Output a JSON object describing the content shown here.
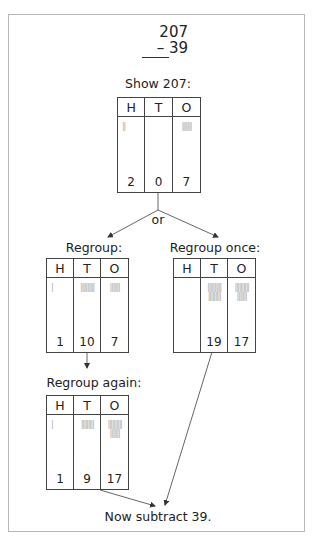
{
  "problem": {
    "top": "207",
    "bottom": "– 39"
  },
  "labels": {
    "show": "Show 207:",
    "or": "or",
    "regroup": "Regroup:",
    "regroup_once": "Regroup once:",
    "regroup_again": "Regroup again:",
    "final": "Now subtract 39."
  },
  "headers": {
    "h": "H",
    "t": "T",
    "o": "O"
  },
  "tables": {
    "show": {
      "h": "2",
      "t": "0",
      "o": "7",
      "h_tally": "||",
      "t_tally": "",
      "o_tally": "|||||||"
    },
    "regroup": {
      "h": "1",
      "t": "10",
      "o": "7",
      "h_tally": "|",
      "t_tally": "||||||||||",
      "o_tally": "|||||||"
    },
    "regroup_once": {
      "h": "",
      "t": "19",
      "o": "17",
      "h_tally": "",
      "t_tally": "||||||||||\n|||||||||",
      "o_tally": "||||||||||\n|||||||"
    },
    "regroup_again": {
      "h": "1",
      "t": "9",
      "o": "17",
      "h_tally": "|",
      "t_tally": "|||||||||",
      "o_tally": "||||||||||\n|||||||"
    }
  }
}
